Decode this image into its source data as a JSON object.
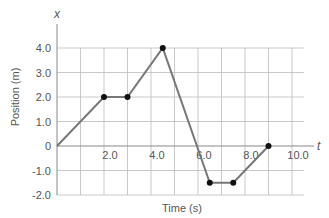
{
  "chart_data": {
    "type": "line",
    "title": "",
    "xlabel": "Time (s)",
    "ylabel": "Position (m)",
    "x_axis_symbol": "t",
    "y_axis_symbol": "x",
    "xlim": [
      0,
      10.5
    ],
    "ylim": [
      -2.0,
      4.0
    ],
    "x_ticks": [
      2.0,
      4.0,
      6.0,
      8.0,
      10.0
    ],
    "x_tick_labels": [
      "2.0",
      "4.0",
      "6.0",
      "8.0",
      "10.0"
    ],
    "y_ticks": [
      4.0,
      3.0,
      2.0,
      1.0,
      0,
      -1.0,
      -2.0
    ],
    "y_tick_labels": [
      "4.0",
      "3.0",
      "2.0",
      "1.0",
      "0",
      "-1.0",
      "-2.0"
    ],
    "grid": true,
    "series": [
      {
        "name": "position",
        "x": [
          0,
          2.0,
          3.0,
          4.5,
          6.5,
          7.5,
          9.0
        ],
        "y": [
          0,
          2.0,
          2.0,
          4.0,
          -1.5,
          -1.5,
          0
        ],
        "markers": [
          false,
          true,
          true,
          true,
          true,
          true,
          true
        ]
      }
    ],
    "colors": {
      "line": "#777777",
      "marker": "#111111",
      "grid": "#bbbbbb",
      "axis": "#888888"
    }
  }
}
